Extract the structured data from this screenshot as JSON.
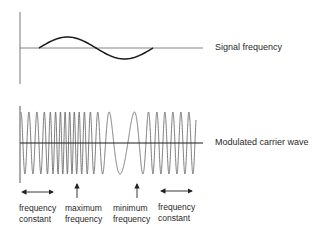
{
  "diagram": {
    "type": "frequency-modulation",
    "signal": {
      "label": "Signal frequency",
      "axis_color": "#555555",
      "wave_color": "#1a1a1a",
      "cycles": 1
    },
    "carrier": {
      "label": "Modulated carrier wave",
      "wave_color": "#555555",
      "axis_color": "#1a1a1a"
    },
    "annotations": [
      {
        "id": "freq-const-left",
        "arrow": "double-horizontal",
        "line1": "frequency",
        "line2": "constant"
      },
      {
        "id": "max-freq",
        "arrow": "up",
        "line1": "maximum",
        "line2": "frequency"
      },
      {
        "id": "min-freq",
        "arrow": "up",
        "line1": "minimum",
        "line2": "frequency"
      },
      {
        "id": "freq-const-right",
        "arrow": "double-horizontal",
        "line1": "frequency",
        "line2": "constant"
      }
    ]
  }
}
